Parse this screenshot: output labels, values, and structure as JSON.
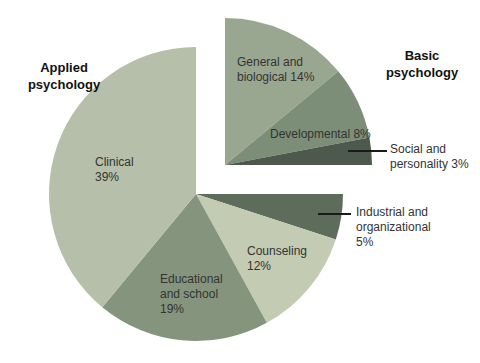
{
  "chart_data": {
    "type": "pie",
    "title": "",
    "unit": "%",
    "background": "#ffffff",
    "leader_color": "#1a1a1a",
    "label_color": "#333333",
    "start_angle_deg": 0,
    "clockwise": true,
    "exploded_group": "basic",
    "groups": [
      {
        "id": "applied",
        "name": "Applied psychology",
        "display": "Applied\npsychology"
      },
      {
        "id": "basic",
        "name": "Basic psychology",
        "display": "Basic\npsychology"
      }
    ],
    "slices": [
      {
        "id": "general-biological",
        "name": "General and biological",
        "value": 14,
        "group": "basic",
        "color": "#9aa790",
        "label": "General and\nbiological 14%"
      },
      {
        "id": "developmental",
        "name": "Developmental",
        "value": 8,
        "group": "basic",
        "color": "#7d8e78",
        "label": "Developmental 8%"
      },
      {
        "id": "social-personality",
        "name": "Social and personality",
        "value": 3,
        "group": "basic",
        "color": "#4d594d",
        "label": "Social and\npersonality 3%"
      },
      {
        "id": "industrial-organizational",
        "name": "Industrial and organizational",
        "value": 5,
        "group": "applied",
        "color": "#5d6c5b",
        "label": "Industrial and\norganizational\n5%"
      },
      {
        "id": "counseling",
        "name": "Counseling",
        "value": 12,
        "group": "applied",
        "color": "#c3cbb2",
        "label": "Counseling\n12%"
      },
      {
        "id": "educational-school",
        "name": "Educational and school",
        "value": 19,
        "group": "applied",
        "color": "#85957d",
        "label": "Educational\nand school\n19%"
      },
      {
        "id": "clinical",
        "name": "Clinical",
        "value": 39,
        "group": "applied",
        "color": "#b6bfa9",
        "label": "Clinical\n39%"
      }
    ]
  }
}
